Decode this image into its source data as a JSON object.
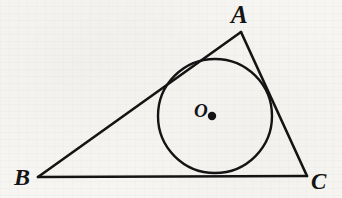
{
  "figure": {
    "name": "triangle-with-inscribed-circle",
    "width": 342,
    "height": 198,
    "background_color": "#f6f5f2",
    "stroke_color": "#141414",
    "labels": {
      "vertex_a": "A",
      "vertex_b": "B",
      "vertex_c": "C",
      "center_o": "O"
    },
    "geometry": {
      "triangle": {
        "vertices": [
          {
            "name": "A",
            "x": 241,
            "y": 32
          },
          {
            "name": "B",
            "x": 38,
            "y": 177
          },
          {
            "name": "C",
            "x": 307,
            "y": 176
          }
        ],
        "stroke_width": 2.6
      },
      "incircle": {
        "center_x": 215,
        "center_y": 116,
        "radius": 57,
        "stroke_width": 2.4,
        "fill": "none"
      },
      "center_dot": {
        "x": 212,
        "y": 116,
        "radius": 4.2
      }
    }
  }
}
